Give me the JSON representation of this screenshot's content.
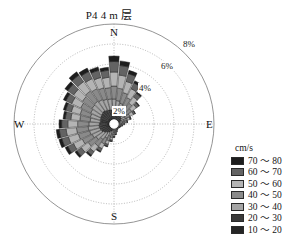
{
  "chart_data": {
    "type": "windrose",
    "title": "P4 4 m 层",
    "legend_title": "cm/s",
    "radial_unit": "%",
    "radial_ticks": [
      "2%",
      "4%",
      "6%",
      "8%"
    ],
    "radial_tick_values": [
      2,
      4,
      6,
      8
    ],
    "rlim": [
      0,
      10
    ],
    "grid": true,
    "legend_position": "right",
    "compass": {
      "n": "N",
      "e": "E",
      "s": "S",
      "w": "W"
    },
    "speed_bins": [
      {
        "label": "70 ～ 80",
        "min": 70,
        "max": 80,
        "color": "#1d1d1d"
      },
      {
        "label": "60 ～ 70",
        "min": 60,
        "max": 70,
        "color": "#636363"
      },
      {
        "label": "50 ～ 60",
        "min": 50,
        "max": 60,
        "color": "#b4b4b4"
      },
      {
        "label": "40 ～ 50",
        "min": 40,
        "max": 50,
        "color": "#8a8a8a"
      },
      {
        "label": "30 ～ 40",
        "min": 30,
        "max": 40,
        "color": "#a5a5a5"
      },
      {
        "label": "20 ～ 30",
        "min": 20,
        "max": 30,
        "color": "#3a3a3a"
      },
      {
        "label": "10 ～ 20",
        "min": 10,
        "max": 20,
        "color": "#252525"
      }
    ],
    "sector_count": 36,
    "sector_width_deg": 10,
    "directions_deg": [
      0,
      10,
      20,
      30,
      40,
      50,
      60,
      70,
      80,
      90,
      100,
      110,
      120,
      130,
      140,
      150,
      160,
      170,
      180,
      190,
      200,
      210,
      220,
      230,
      240,
      250,
      260,
      270,
      280,
      290,
      300,
      310,
      320,
      330,
      340,
      350
    ],
    "series": [
      {
        "name": "10 ～ 20",
        "color": "#252525",
        "values": [
          0.55,
          0.5,
          0.48,
          0.45,
          0.42,
          0.4,
          0.35,
          0.3,
          0.28,
          0.26,
          0.24,
          0.22,
          0.22,
          0.2,
          0.2,
          0.2,
          0.22,
          0.24,
          0.26,
          0.3,
          0.34,
          0.4,
          0.46,
          0.52,
          0.58,
          0.6,
          0.62,
          0.6,
          0.58,
          0.6,
          0.62,
          0.64,
          0.66,
          0.64,
          0.6,
          0.58
        ]
      },
      {
        "name": "20 ～ 30",
        "color": "#3a3a3a",
        "values": [
          0.85,
          0.8,
          0.72,
          0.66,
          0.6,
          0.52,
          0.44,
          0.36,
          0.3,
          0.26,
          0.22,
          0.2,
          0.18,
          0.16,
          0.16,
          0.18,
          0.2,
          0.24,
          0.3,
          0.36,
          0.44,
          0.54,
          0.64,
          0.74,
          0.82,
          0.86,
          0.88,
          0.86,
          0.82,
          0.84,
          0.88,
          0.92,
          0.96,
          0.92,
          0.88,
          0.86
        ]
      },
      {
        "name": "30 ～ 40",
        "color": "#a5a5a5",
        "values": [
          1.1,
          1.05,
          0.95,
          0.85,
          0.72,
          0.6,
          0.48,
          0.38,
          0.3,
          0.24,
          0.2,
          0.16,
          0.14,
          0.12,
          0.12,
          0.14,
          0.18,
          0.22,
          0.28,
          0.38,
          0.5,
          0.64,
          0.8,
          0.94,
          1.02,
          1.08,
          1.1,
          1.06,
          1.0,
          1.02,
          1.08,
          1.14,
          1.18,
          1.14,
          1.1,
          1.08
        ]
      },
      {
        "name": "40 ～ 50",
        "color": "#8a8a8a",
        "values": [
          1.3,
          1.25,
          1.12,
          0.98,
          0.82,
          0.66,
          0.5,
          0.36,
          0.26,
          0.18,
          0.14,
          0.1,
          0.08,
          0.08,
          0.08,
          0.1,
          0.14,
          0.18,
          0.24,
          0.34,
          0.48,
          0.64,
          0.82,
          0.98,
          1.1,
          1.16,
          1.18,
          1.12,
          1.04,
          1.06,
          1.12,
          1.2,
          1.26,
          1.22,
          1.18,
          1.14
        ]
      },
      {
        "name": "50 ～ 60",
        "color": "#b4b4b4",
        "values": [
          1.4,
          1.32,
          1.16,
          0.98,
          0.78,
          0.58,
          0.4,
          0.26,
          0.16,
          0.1,
          0.06,
          0.04,
          0.04,
          0.04,
          0.04,
          0.06,
          0.08,
          0.12,
          0.16,
          0.24,
          0.36,
          0.52,
          0.7,
          0.86,
          0.98,
          1.04,
          1.04,
          0.98,
          0.9,
          0.92,
          1.0,
          1.08,
          1.16,
          1.12,
          1.08,
          1.04
        ]
      },
      {
        "name": "60 ～ 70",
        "color": "#636363",
        "values": [
          1.05,
          0.96,
          0.8,
          0.64,
          0.46,
          0.3,
          0.18,
          0.1,
          0.06,
          0.04,
          0.02,
          0.02,
          0.02,
          0.02,
          0.02,
          0.02,
          0.04,
          0.06,
          0.08,
          0.12,
          0.2,
          0.3,
          0.42,
          0.54,
          0.64,
          0.68,
          0.68,
          0.62,
          0.56,
          0.58,
          0.64,
          0.72,
          0.8,
          0.78,
          0.74,
          0.7
        ]
      },
      {
        "name": "70 ～ 80",
        "color": "#1d1d1d",
        "values": [
          0.55,
          0.46,
          0.34,
          0.24,
          0.14,
          0.08,
          0.04,
          0.02,
          0.01,
          0.0,
          0.0,
          0.0,
          0.0,
          0.0,
          0.0,
          0.0,
          0.0,
          0.01,
          0.02,
          0.03,
          0.06,
          0.1,
          0.16,
          0.22,
          0.28,
          0.3,
          0.3,
          0.26,
          0.22,
          0.24,
          0.28,
          0.34,
          0.4,
          0.38,
          0.34,
          0.3
        ]
      }
    ]
  }
}
